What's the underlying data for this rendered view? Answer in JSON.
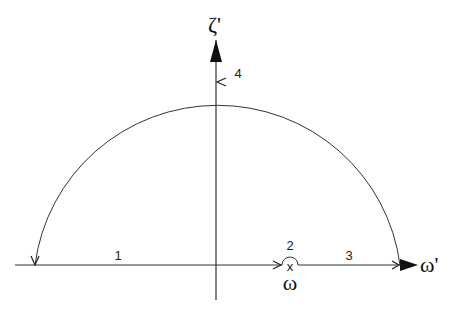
{
  "diagram": {
    "type": "contour-integration-path",
    "axes": {
      "horizontal_label": "ω'",
      "vertical_label": "ζ'"
    },
    "pole": {
      "marker": "x",
      "label": "ω"
    },
    "segments": [
      {
        "id": "1",
        "label": "1",
        "description": "along real axis from left toward pole"
      },
      {
        "id": "2",
        "label": "2",
        "description": "small semicircle indentation above pole"
      },
      {
        "id": "3",
        "label": "3",
        "description": "along real axis from pole to right end"
      },
      {
        "id": "4",
        "label": "4",
        "description": "large semicircular arc in upper half-plane, counterclockwise"
      }
    ],
    "colors": {
      "stroke": "#222222",
      "background": "#ffffff"
    }
  }
}
